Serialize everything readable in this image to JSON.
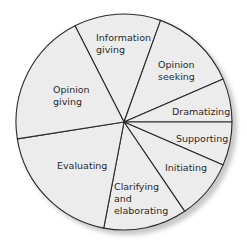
{
  "chart_data": {
    "type": "pie",
    "title": "",
    "categories": [
      "Information giving",
      "Opinion seeking",
      "Dramatizing",
      "Supporting",
      "Initiating",
      "Clarifying and elaborating",
      "Evaluating",
      "Opinion giving"
    ],
    "values": [
      13,
      13,
      6.5,
      6.5,
      9,
      12.5,
      19.5,
      20
    ],
    "unit": "percent (estimated from slice angles)",
    "start_angle_deg": 243,
    "direction": "clockwise",
    "legend": "none (labels inside slices)",
    "colors": {
      "fill": "#ececec",
      "stroke": "#2b2b2b",
      "shadow": "#c9c9c9",
      "text": "#2a2a2a"
    }
  },
  "labels": {
    "information_giving": [
      "Information",
      "giving"
    ],
    "opinion_seeking": [
      "Opinion",
      "seeking"
    ],
    "dramatizing": [
      "Dramatizing"
    ],
    "supporting": [
      "Supporting"
    ],
    "initiating": [
      "Initiating"
    ],
    "clarifying": [
      "Clarifying",
      "and",
      "elaborating"
    ],
    "evaluating": [
      "Evaluating"
    ],
    "opinion_giving": [
      "Opinion",
      "giving"
    ]
  }
}
